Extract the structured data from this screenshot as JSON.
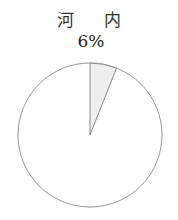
{
  "chart_data": {
    "type": "pie",
    "title": "河 内",
    "categories": [
      "highlighted",
      "rest"
    ],
    "values": [
      6,
      94
    ],
    "annotations": [
      "6%"
    ],
    "colors": {
      "highlighted": "#eeeeee",
      "rest": "#ffffff",
      "stroke": "#999999"
    }
  },
  "labels": {
    "title": "河 内",
    "percent": "6%"
  }
}
